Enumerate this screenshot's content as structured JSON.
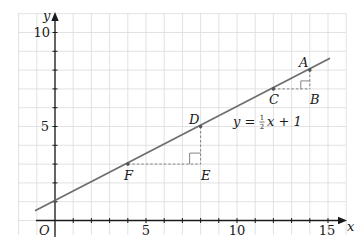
{
  "diagram": {
    "type": "coordinate-graph",
    "axes": {
      "x_label": "x",
      "y_label": "y",
      "origin_label": "O",
      "x_ticks": [
        "5",
        "10",
        "15"
      ],
      "y_ticks": [
        "5",
        "10"
      ],
      "x_range": [
        -2,
        16
      ],
      "y_range": [
        -0.75,
        11
      ]
    },
    "line": {
      "equation_prefix": "y = ",
      "fraction_num": "1",
      "fraction_den": "2",
      "equation_suffix": "x + 1",
      "slope": 0.5,
      "intercept": 1,
      "color": "#6e6e6e"
    },
    "points": [
      {
        "label": "A",
        "x": 14,
        "y": 8
      },
      {
        "label": "B",
        "x": 14,
        "y": 7
      },
      {
        "label": "C",
        "x": 12,
        "y": 7
      },
      {
        "label": "D",
        "x": 8,
        "y": 5
      },
      {
        "label": "E",
        "x": 8,
        "y": 3
      },
      {
        "label": "F",
        "x": 4,
        "y": 3
      }
    ],
    "triangles": [
      {
        "vertices": [
          "A",
          "C",
          "B"
        ],
        "right_angle_at": "B"
      },
      {
        "vertices": [
          "D",
          "F",
          "E"
        ],
        "right_angle_at": "E"
      }
    ],
    "colors": {
      "grid": "#d9d9d9",
      "axis": "#1a1a1a",
      "line": "#6e6e6e",
      "dashed": "#777777"
    }
  }
}
